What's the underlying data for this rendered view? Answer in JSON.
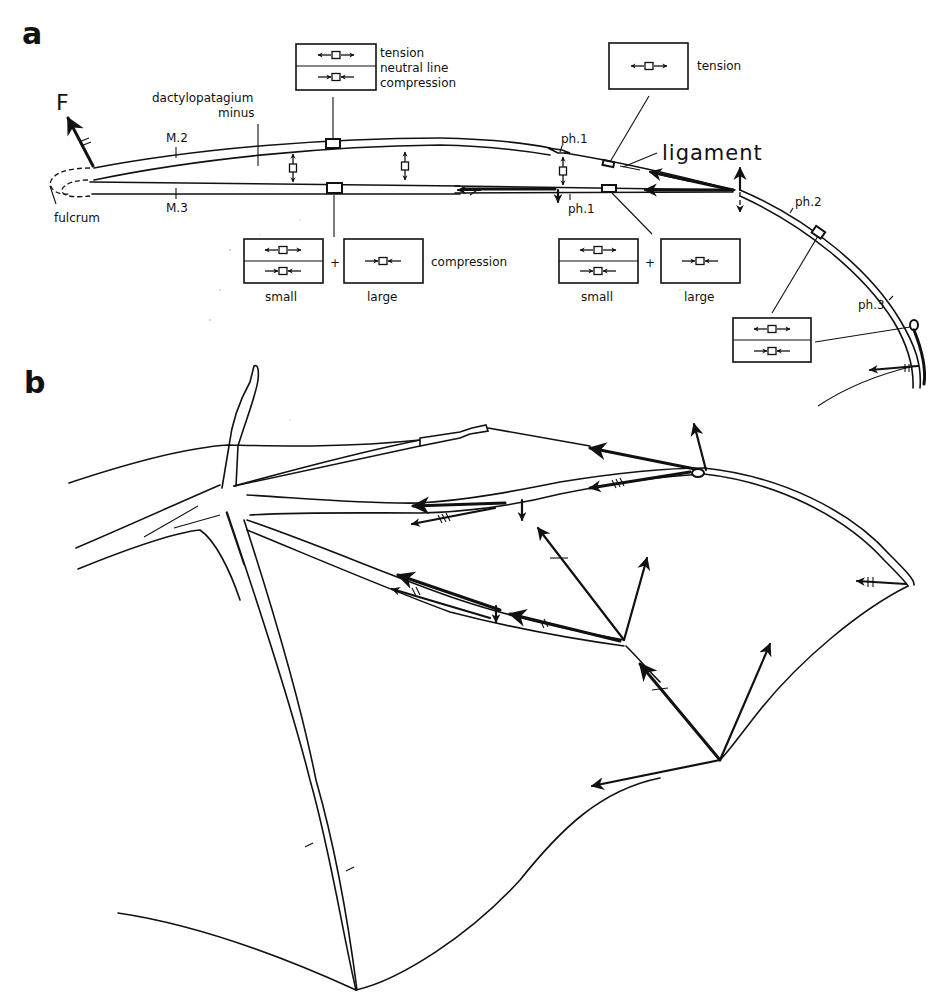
{
  "figure": {
    "panel_a": {
      "label": "a",
      "force_label": "F",
      "structure_labels": {
        "dactylopatagium_line1": "dactylopatagium",
        "dactylopatagium_line2": "minus",
        "m2": "M.2",
        "m3": "M.3",
        "fulcrum": "fulcrum",
        "ph1_upper": "ph.1",
        "ph1_lower": "ph.1",
        "ph2": "ph.2",
        "ph3": "ph.3",
        "ligament": "ligament"
      },
      "legend_box_top": {
        "line1": "tension",
        "line2": "neutral line",
        "line3": "compression"
      },
      "legend_box_right": {
        "label": "tension"
      },
      "bottom_left_group": {
        "small_label": "small",
        "large_label": "large",
        "plus": "+",
        "side_label": "compression"
      },
      "bottom_right_group": {
        "small_label": "small",
        "large_label": "large",
        "plus": "+"
      }
    },
    "panel_b": {
      "label": "b"
    }
  },
  "colors": {
    "ink": "#111111",
    "paper": "#ffffff",
    "speckle": "#cfcfcf"
  }
}
